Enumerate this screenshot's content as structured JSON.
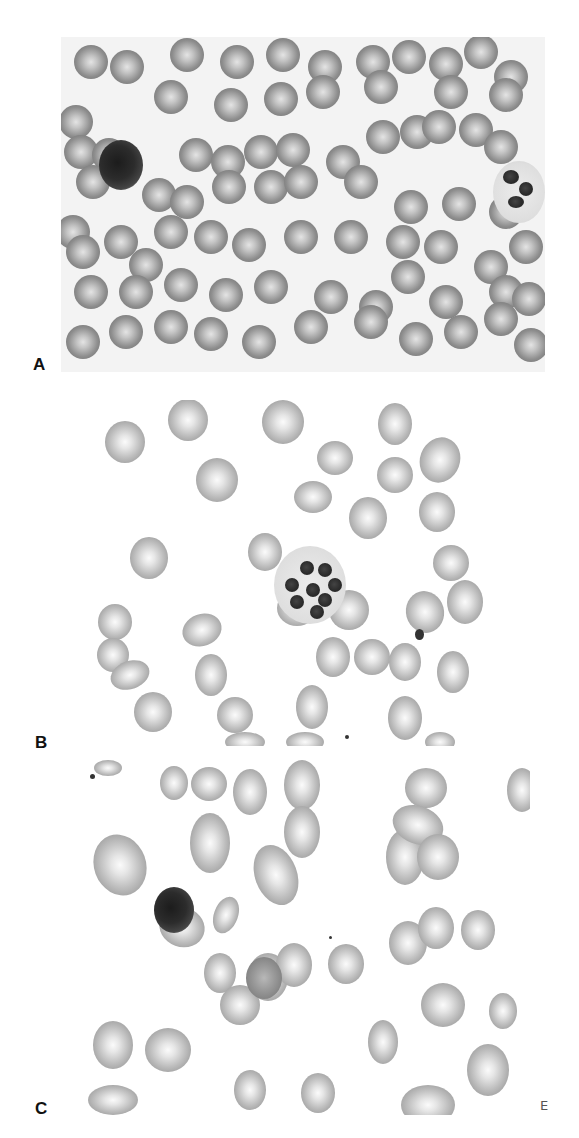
{
  "figure": {
    "panels": [
      {
        "label": "A",
        "bg": "#f3f3f3",
        "box": {
          "x": 61,
          "y": 37,
          "w": 484,
          "h": 335
        },
        "label_pos": {
          "x": 33,
          "y": 356
        }
      },
      {
        "label": "B",
        "bg": "#ffffff",
        "box": {
          "x": 85,
          "y": 400,
          "w": 450,
          "h": 346
        },
        "label_pos": {
          "x": 35,
          "y": 734
        }
      },
      {
        "label": "C",
        "bg": "#ffffff",
        "box": {
          "x": 78,
          "y": 760,
          "w": 452,
          "h": 355
        },
        "label_pos": {
          "x": 35,
          "y": 1100
        }
      }
    ],
    "corner_mark": {
      "text": "E",
      "x": 540,
      "y": 1099
    }
  }
}
